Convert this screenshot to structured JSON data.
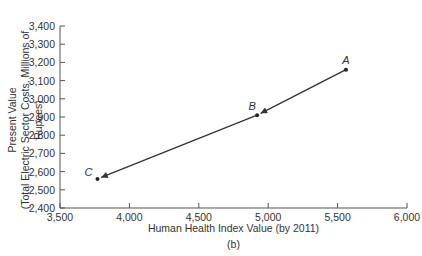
{
  "chart_data": {
    "type": "line",
    "title": "",
    "subtitle": "(b)",
    "xlabel": "Human Health Index Value (by 2011)",
    "ylabel_line1": "Present Value",
    "ylabel_line2": "(Total Electric Sector Costs, Millions of Rupees)",
    "xlim": [
      3500,
      6000
    ],
    "ylim": [
      2400,
      3400
    ],
    "x_ticks": [
      "3,500",
      "4,000",
      "4,500",
      "5,000",
      "5,500",
      "6,000"
    ],
    "y_ticks": [
      "2,400",
      "2,500",
      "2,600",
      "2,700",
      "2,800",
      "2,900",
      "3,000",
      "3,100",
      "3,200",
      "3,300",
      "3,400"
    ],
    "grid": false,
    "legend": null,
    "points": [
      {
        "label": "A",
        "x": 5560,
        "y": 3160
      },
      {
        "label": "B",
        "x": 4920,
        "y": 2910
      },
      {
        "label": "C",
        "x": 3770,
        "y": 2560
      }
    ],
    "arrows": [
      {
        "from": "A",
        "to": "B"
      },
      {
        "from": "B",
        "to": "C"
      }
    ]
  }
}
